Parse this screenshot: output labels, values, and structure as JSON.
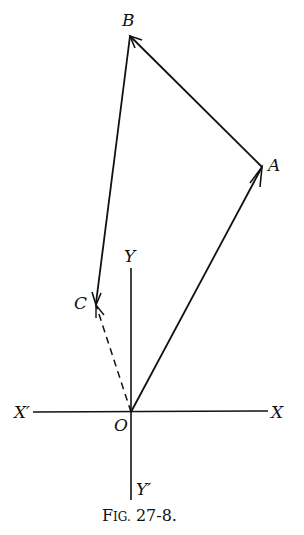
{
  "figure": {
    "caption_prefix": "F",
    "caption_smallcaps": "IG.",
    "caption_number": " 27-8.",
    "caption": "Fig. 27-8."
  },
  "axes": {
    "x_label": "X",
    "x_prime_label": "X′",
    "y_label": "Y",
    "y_prime_label": "Y′",
    "origin_label": "O"
  },
  "points": {
    "O": {
      "label": "O",
      "x": 131,
      "y": 412
    },
    "A": {
      "label": "A",
      "x": 262,
      "y": 166
    },
    "B": {
      "label": "B",
      "x": 130,
      "y": 36
    },
    "C": {
      "label": "C",
      "x": 96,
      "y": 303
    }
  },
  "vectors": [
    {
      "from": "O",
      "to": "A",
      "style": "solid",
      "arrow": "mid-end"
    },
    {
      "from": "A",
      "to": "B",
      "style": "solid",
      "arrow": "end"
    },
    {
      "from": "B",
      "to": "C",
      "style": "solid",
      "arrow": "end"
    },
    {
      "from": "O",
      "to": "C",
      "style": "dashed",
      "arrow": "end"
    }
  ],
  "colors": {
    "ink": "#111111",
    "background": "#ffffff"
  }
}
